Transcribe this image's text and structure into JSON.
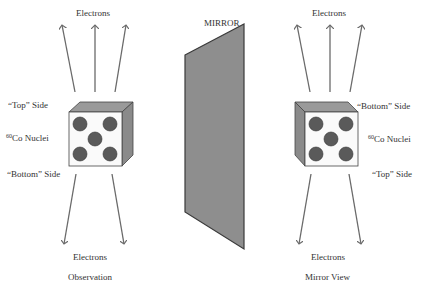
{
  "mirror": {
    "label": "MIRROR",
    "fill": "#8e8e8e"
  },
  "observation": {
    "caption": "Observation",
    "electrons_top": "Electrons",
    "electrons_bottom": "Electrons",
    "top_side": "“Top” Side",
    "nuclei_sup": "60",
    "nuclei": "Co Nuclei",
    "bottom_side": "“Bottom” Side"
  },
  "mirror_view": {
    "caption": "Mirror View",
    "electrons_top": "Electrons",
    "electrons_bottom": "Electrons",
    "bottom_side": "“Bottom” Side",
    "nuclei_sup": "60",
    "nuclei": "Co Nuclei",
    "top_side": "“Top” Side"
  },
  "colors": {
    "arrow": "#6a6a6a",
    "cube_top": "#9a9a9a",
    "cube_side": "#8a8a8a",
    "nucleus": "#5a5a5a"
  }
}
